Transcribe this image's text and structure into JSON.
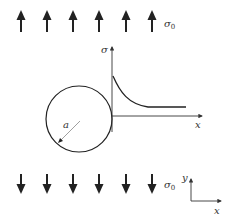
{
  "diagram": {
    "load_label": "σ",
    "load_subscript": "0",
    "stress_axis_label": "σ",
    "x_axis_label": "x",
    "radius_label": "a",
    "coord_y_label": "y",
    "coord_x_label": "x",
    "top_arrows_count": 6,
    "bottom_arrows_count": 6,
    "colors": {
      "stroke": "#222222",
      "text": "#333333"
    }
  }
}
